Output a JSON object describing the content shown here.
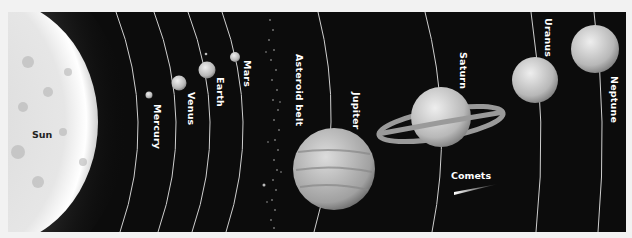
{
  "diagram": {
    "sun": {
      "label": "Sun"
    },
    "bodies": [
      {
        "label": "Mercury"
      },
      {
        "label": "Venus"
      },
      {
        "label": "Earth"
      },
      {
        "label": "Mars"
      },
      {
        "label": "Asteroid belt"
      },
      {
        "label": "Jupiter"
      },
      {
        "label": "Saturn"
      },
      {
        "label": "Uranus"
      },
      {
        "label": "Neptune"
      }
    ],
    "comets": {
      "label": "Comets"
    },
    "colors": {
      "background": "#0c0c0c",
      "orbit": "#d0d0d0",
      "label": "#ffffff"
    }
  }
}
